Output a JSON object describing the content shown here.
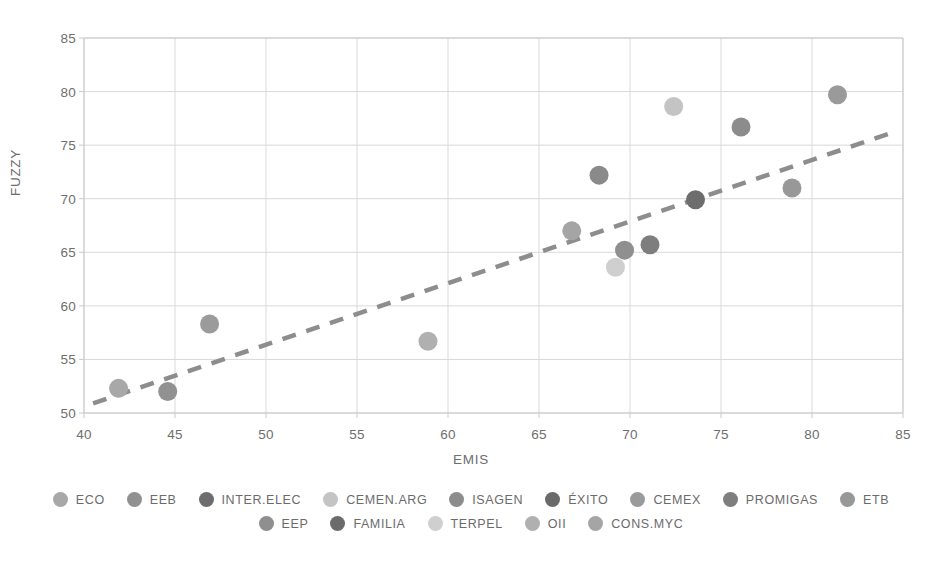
{
  "chart_data": {
    "type": "scatter",
    "title": "",
    "xlabel": "EMIS",
    "ylabel": "FUZZY",
    "xlim": [
      40,
      85
    ],
    "ylim": [
      50,
      85
    ],
    "xticks": [
      40,
      45,
      50,
      55,
      60,
      65,
      70,
      75,
      80,
      85
    ],
    "yticks": [
      50,
      55,
      60,
      65,
      70,
      75,
      80,
      85
    ],
    "grid": true,
    "legend_position": "bottom",
    "points": [
      {
        "label": "ECO",
        "x": 41.9,
        "y": 52.3,
        "color": "#a8a8a8"
      },
      {
        "label": "EEB",
        "x": 44.6,
        "y": 52.0,
        "color": "#919191"
      },
      {
        "label": "INTER.ELEC",
        "x": 73.6,
        "y": 69.9,
        "color": "#6d6d6d"
      },
      {
        "label": "CEMEN.ARG",
        "x": 72.4,
        "y": 78.6,
        "color": "#c4c4c4"
      },
      {
        "label": "ISAGEN",
        "x": 76.1,
        "y": 76.7,
        "color": "#8c8c8c"
      },
      {
        "label": "ÉXITO",
        "x": 68.3,
        "y": 72.2,
        "color": "#8a8a8a"
      },
      {
        "label": "CEMEX",
        "x": 81.4,
        "y": 79.7,
        "color": "#9a9a9a"
      },
      {
        "label": "PROMIGAS",
        "x": 71.1,
        "y": 65.7,
        "color": "#7e7e7e"
      },
      {
        "label": "ETB",
        "x": 78.9,
        "y": 71.0,
        "color": "#989898"
      },
      {
        "label": "EEP",
        "x": 69.7,
        "y": 65.2,
        "color": "#8f8f8f"
      },
      {
        "label": "FAMILIA",
        "x": 46.9,
        "y": 58.3,
        "color": "#9b9b9b"
      },
      {
        "label": "TERPEL",
        "x": 69.2,
        "y": 63.6,
        "color": "#cfcfcf"
      },
      {
        "label": "OII",
        "x": 58.9,
        "y": 56.7,
        "color": "#b0b0b0"
      },
      {
        "label": "CONS.MYC",
        "x": 66.8,
        "y": 67.0,
        "color": "#a5a5a5"
      }
    ],
    "trendline": {
      "x0": 40.5,
      "y0": 50.9,
      "x1": 84.3,
      "y1": 76.1,
      "style": "dashed",
      "color": "#8d8d8d"
    }
  },
  "axis": {
    "x_title": "EMIS",
    "y_title": "FUZZY",
    "x_ticks": [
      "40",
      "45",
      "50",
      "55",
      "60",
      "65",
      "70",
      "75",
      "80",
      "85"
    ],
    "y_ticks": [
      "50",
      "55",
      "60",
      "65",
      "70",
      "75",
      "80",
      "85"
    ]
  },
  "legend": {
    "row1": [
      {
        "label": "ECO",
        "color": "#a8a8a8"
      },
      {
        "label": "EEB",
        "color": "#919191"
      },
      {
        "label": "INTER.ELEC",
        "color": "#6d6d6d"
      },
      {
        "label": "CEMEN.ARG",
        "color": "#c4c4c4"
      },
      {
        "label": "ISAGEN",
        "color": "#8c8c8c"
      },
      {
        "label": "ÉXITO",
        "color": "#6a6a6a"
      },
      {
        "label": "CEMEX",
        "color": "#9a9a9a"
      },
      {
        "label": "PROMIGAS",
        "color": "#7e7e7e"
      },
      {
        "label": "ETB",
        "color": "#989898"
      }
    ],
    "row2": [
      {
        "label": "EEP",
        "color": "#8f8f8f"
      },
      {
        "label": "FAMILIA",
        "color": "#6b6b6b"
      },
      {
        "label": "TERPEL",
        "color": "#cfcfcf"
      },
      {
        "label": "OII",
        "color": "#b0b0b0"
      },
      {
        "label": "CONS.MYC",
        "color": "#a5a5a5"
      }
    ]
  },
  "colors": {
    "grid": "#d9d9d9",
    "axis": "#c9c9c9",
    "text": "#6e6e6e",
    "trend": "#8d8d8d",
    "background": "#ffffff"
  }
}
